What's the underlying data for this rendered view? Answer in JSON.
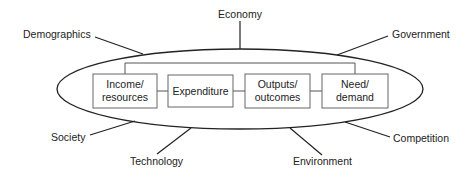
{
  "diagram": {
    "core_boxes": [
      {
        "id": "income",
        "lines": [
          "Income/",
          "resources"
        ]
      },
      {
        "id": "expenditure",
        "lines": [
          "Expenditure"
        ]
      },
      {
        "id": "outputs",
        "lines": [
          "Outputs/",
          "outcomes"
        ]
      },
      {
        "id": "need",
        "lines": [
          "Need/",
          "demand"
        ]
      }
    ],
    "external_factors": [
      {
        "id": "economy",
        "label": "Economy"
      },
      {
        "id": "demographics",
        "label": "Demographics"
      },
      {
        "id": "government",
        "label": "Government"
      },
      {
        "id": "society",
        "label": "Society"
      },
      {
        "id": "technology",
        "label": "Technology"
      },
      {
        "id": "environment",
        "label": "Environment"
      },
      {
        "id": "competition",
        "label": "Competition"
      }
    ],
    "colors": {
      "line": "#222222",
      "box_border": "#666666",
      "background": "#ffffff"
    }
  }
}
